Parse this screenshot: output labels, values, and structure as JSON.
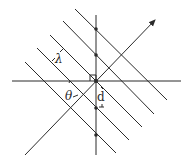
{
  "diagram": {
    "type": "wavefront-geometry",
    "labels": {
      "wavelength": "λ",
      "angle": "θ",
      "spacing": "d"
    },
    "colors": {
      "stroke": "#2b2b2b",
      "background": "#ffffff"
    },
    "elements": {
      "horizontal_axis": {
        "x1": 12,
        "y1": 81,
        "x2": 181,
        "y2": 81
      },
      "vertical_axis": {
        "x1": 96,
        "y1": 15,
        "x2": 96,
        "y2": 155
      },
      "propagation_arrow": {
        "x1": 25,
        "y1": 155,
        "x2": 155,
        "y2": 20
      },
      "wavefronts": [
        {
          "x1": 75,
          "y1": 9,
          "x2": 167,
          "y2": 100
        },
        {
          "x1": 63,
          "y1": 21,
          "x2": 154,
          "y2": 114
        },
        {
          "x1": 50,
          "y1": 35,
          "x2": 142,
          "y2": 127
        },
        {
          "x1": 37,
          "y1": 48,
          "x2": 129,
          "y2": 140
        },
        {
          "x1": 25,
          "y1": 62,
          "x2": 116,
          "y2": 153
        }
      ],
      "intersection_dots": [
        {
          "x": 96,
          "y": 29
        },
        {
          "x": 96,
          "y": 55
        },
        {
          "x": 96,
          "y": 81
        },
        {
          "x": 96,
          "y": 108
        },
        {
          "x": 96,
          "y": 135
        }
      ]
    }
  }
}
